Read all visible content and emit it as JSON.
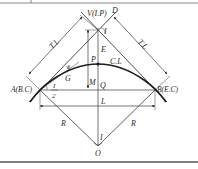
{
  "colors": {
    "line": "#3a3a3a",
    "curve": "#1e1e1e",
    "frame": "#555555",
    "background": "#ffffff"
  },
  "labels": {
    "vertex": "V(I.P)",
    "d": "D",
    "intersection_angle_top": "I",
    "tangent_left": "T.L",
    "tangent_right": "T.L",
    "external": "E",
    "mid_point": "P",
    "curve_length": "C.L",
    "deflection": "δ",
    "chord_g": "G",
    "middle_ordinate": "M",
    "q": "Q",
    "bc": "A(B.C)",
    "ec": "B(E.C)",
    "half_angle_num": "I",
    "half_angle_den": "2",
    "long_chord": "L",
    "radius_left": "R",
    "radius_right": "R",
    "center_angle": "I",
    "center": "O"
  }
}
